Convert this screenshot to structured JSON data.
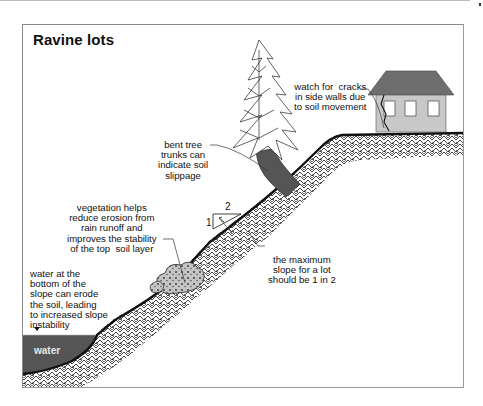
{
  "title": "Ravine lots",
  "annotations": {
    "house_cracks": "watch for  cracks\nin side walls due\nto soil movement",
    "bent_trees": "bent tree\ntrunks can\nindicate soil\nslippage",
    "vegetation": "vegetation helps\nreduce erosion from\nrain runoff and\nimproves the stability\nof the top  soil layer",
    "water_erosion": "water at the\nbottom of the\nslope can erode\nthe soil, leading\nto increased slope\ninstability",
    "max_slope": "the maximum\nslope for a lot\nshould be 1 in 2"
  },
  "water_label": "water",
  "slope_ratio": {
    "rise": "1",
    "run": "2"
  },
  "icons": [
    "house-icon",
    "tree-icon",
    "shrub-icon",
    "slope-triangle-icon",
    "water-level-marker-icon"
  ],
  "colors": {
    "soil_line": "#111111",
    "house_wall": "#c8c8c8",
    "house_roof": "#6e6e6e",
    "tree_trunk": "#555555",
    "water": "#555555",
    "shrub": "#bdbdbd"
  }
}
